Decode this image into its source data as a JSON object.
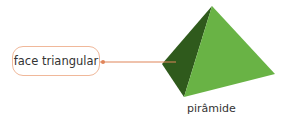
{
  "diagram": {
    "label": "face triangular",
    "caption": "pirâmide",
    "colors": {
      "face_dark": "#2f5a1c",
      "face_light": "#69b345",
      "leader_line": "#e0855a",
      "label_border": "#f0b89a"
    }
  }
}
